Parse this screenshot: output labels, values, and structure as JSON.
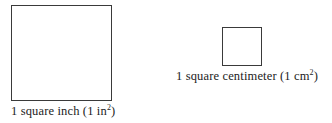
{
  "figure": {
    "background_color": "#ffffff",
    "stroke_color": "#3a3a3a",
    "text_color": "#1c1c1c",
    "shapes": [
      {
        "name": "square-inch",
        "label_text": "1 square inch (1 in",
        "label_superscript": "2",
        "label_tail": ")",
        "full_label": "1 square inch (1 in2)",
        "width_px": 101,
        "height_px": 96,
        "x_px": 11,
        "y_px": 5,
        "fill": "none"
      },
      {
        "name": "square-centimeter",
        "label_text": "1 square centimeter (1 cm",
        "label_superscript": "2",
        "label_tail": ")",
        "full_label": "1 square centimeter (1 cm2)",
        "width_px": 40,
        "height_px": 39,
        "x_px": 222,
        "y_px": 27,
        "fill": "none"
      }
    ]
  }
}
